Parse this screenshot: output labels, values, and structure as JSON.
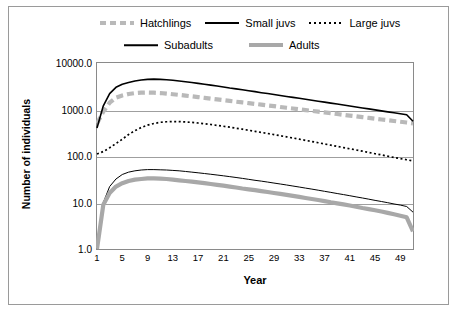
{
  "chart_data": {
    "type": "line",
    "title": "",
    "xlabel": "Year",
    "ylabel": "Number of individuals",
    "yscale": "log",
    "ylim": [
      1.0,
      10000.0
    ],
    "xlim": [
      1,
      51
    ],
    "grid": true,
    "legend_position": "top",
    "ytick_labels": [
      "10000.0",
      "1000.0",
      "100.0",
      "10.0",
      "1.0"
    ],
    "ytick_values": [
      10000,
      1000,
      100,
      10,
      1
    ],
    "xtick_labels": [
      "1",
      "5",
      "9",
      "13",
      "17",
      "21",
      "25",
      "29",
      "33",
      "37",
      "41",
      "45",
      "49"
    ],
    "xtick_values": [
      1,
      5,
      9,
      13,
      17,
      21,
      25,
      29,
      33,
      37,
      41,
      45,
      49
    ],
    "series": [
      {
        "name": "Hatchlings",
        "color": "#b9b9b9",
        "style": "dashed-thick",
        "x": [
          1,
          2,
          3,
          4,
          5,
          6,
          7,
          8,
          9,
          10,
          11,
          12,
          13,
          14,
          15,
          16,
          17,
          18,
          19,
          20,
          21,
          22,
          23,
          24,
          25,
          26,
          27,
          28,
          29,
          30,
          31,
          32,
          33,
          34,
          35,
          36,
          37,
          38,
          39,
          40,
          41,
          42,
          43,
          44,
          45,
          46,
          47,
          48,
          49,
          50,
          51
        ],
        "values": [
          500,
          900,
          1400,
          1800,
          2000,
          2150,
          2250,
          2300,
          2320,
          2300,
          2260,
          2200,
          2130,
          2060,
          1990,
          1920,
          1850,
          1780,
          1710,
          1650,
          1590,
          1530,
          1470,
          1420,
          1370,
          1320,
          1270,
          1220,
          1180,
          1130,
          1090,
          1050,
          1010,
          970,
          935,
          900,
          865,
          835,
          800,
          770,
          740,
          715,
          685,
          660,
          635,
          610,
          590,
          565,
          545,
          525,
          505
        ]
      },
      {
        "name": "Small juvs",
        "color": "#000000",
        "style": "solid-medium",
        "x": [
          1,
          2,
          3,
          4,
          5,
          6,
          7,
          8,
          9,
          10,
          11,
          12,
          13,
          14,
          15,
          16,
          17,
          18,
          19,
          20,
          21,
          22,
          23,
          24,
          25,
          26,
          27,
          28,
          29,
          30,
          31,
          32,
          33,
          34,
          35,
          36,
          37,
          38,
          39,
          40,
          41,
          42,
          43,
          44,
          45,
          46,
          47,
          48,
          49,
          50,
          51
        ],
        "values": [
          400,
          1200,
          2200,
          3000,
          3500,
          3800,
          4100,
          4300,
          4450,
          4500,
          4450,
          4350,
          4250,
          4100,
          3950,
          3800,
          3650,
          3500,
          3350,
          3200,
          3050,
          2900,
          2780,
          2650,
          2530,
          2420,
          2300,
          2200,
          2100,
          2000,
          1910,
          1820,
          1740,
          1660,
          1580,
          1510,
          1440,
          1370,
          1310,
          1250,
          1190,
          1130,
          1080,
          1030,
          980,
          935,
          890,
          850,
          810,
          770,
          560
        ]
      },
      {
        "name": "Large juvs",
        "color": "#000000",
        "style": "dotted-medium",
        "x": [
          1,
          2,
          3,
          4,
          5,
          6,
          7,
          8,
          9,
          10,
          11,
          12,
          13,
          14,
          15,
          16,
          17,
          18,
          19,
          20,
          21,
          22,
          23,
          24,
          25,
          26,
          27,
          28,
          29,
          30,
          31,
          32,
          33,
          34,
          35,
          36,
          37,
          38,
          39,
          40,
          41,
          42,
          43,
          44,
          45,
          46,
          47,
          48,
          49,
          50,
          51
        ],
        "values": [
          110,
          125,
          150,
          185,
          230,
          290,
          350,
          410,
          460,
          500,
          530,
          545,
          550,
          548,
          540,
          528,
          512,
          495,
          475,
          456,
          436,
          416,
          396,
          377,
          358,
          340,
          322,
          305,
          289,
          273,
          258,
          244,
          230,
          217,
          205,
          193,
          182,
          171,
          161,
          152,
          143,
          135,
          127,
          119,
          112,
          106,
          99,
          93,
          88,
          83,
          78
        ]
      },
      {
        "name": "Subadults",
        "color": "#000000",
        "style": "solid-thin",
        "x": [
          1,
          2,
          3,
          4,
          5,
          6,
          7,
          8,
          9,
          10,
          11,
          12,
          13,
          14,
          15,
          16,
          17,
          18,
          19,
          20,
          21,
          22,
          23,
          24,
          25,
          26,
          27,
          28,
          29,
          30,
          31,
          32,
          33,
          34,
          35,
          36,
          37,
          38,
          39,
          40,
          41,
          42,
          43,
          44,
          45,
          46,
          47,
          48,
          49,
          50,
          51
        ],
        "values": [
          1.0,
          10,
          22,
          32,
          40,
          45,
          48,
          50,
          51,
          51,
          50.5,
          50,
          49,
          48,
          46.5,
          45,
          43.5,
          42,
          40.5,
          39,
          37.5,
          36,
          34.5,
          33,
          31.5,
          30,
          28.8,
          27.5,
          26.2,
          25,
          23.8,
          22.6,
          21.5,
          20.4,
          19.4,
          18.4,
          17.4,
          16.5,
          15.6,
          14.8,
          14,
          13.2,
          12.5,
          11.8,
          11.1,
          10.5,
          9.9,
          9.3,
          8.8,
          8.2,
          6.2
        ]
      },
      {
        "name": "Adults",
        "color": "#a8a8a8",
        "style": "solid-thick",
        "x": [
          1,
          2,
          3,
          4,
          5,
          6,
          7,
          8,
          9,
          10,
          11,
          12,
          13,
          14,
          15,
          16,
          17,
          18,
          19,
          20,
          21,
          22,
          23,
          24,
          25,
          26,
          27,
          28,
          29,
          30,
          31,
          32,
          33,
          34,
          35,
          36,
          37,
          38,
          39,
          40,
          41,
          42,
          43,
          44,
          45,
          46,
          47,
          48,
          49,
          50,
          51
        ],
        "values": [
          1.0,
          9,
          16,
          22,
          26,
          29,
          31,
          32,
          33,
          33,
          32.5,
          32,
          31,
          30,
          29,
          28,
          27,
          26,
          25,
          24,
          23,
          22,
          21,
          20,
          19.2,
          18.4,
          17.6,
          16.8,
          16,
          15.3,
          14.6,
          13.9,
          13.2,
          12.5,
          11.9,
          11.3,
          10.7,
          10.1,
          9.6,
          9.1,
          8.6,
          8.1,
          7.6,
          7.2,
          6.8,
          6.4,
          6,
          5.6,
          5.2,
          4.8,
          2.4
        ]
      }
    ]
  },
  "legend": {
    "items": [
      {
        "label": "Hatchlings",
        "key": "hatchlings"
      },
      {
        "label": "Small juvs",
        "key": "smalljuvs"
      },
      {
        "label": "Large juvs",
        "key": "largejuvs"
      },
      {
        "label": "Subadults",
        "key": "subadults"
      },
      {
        "label": "Adults",
        "key": "adults"
      }
    ]
  },
  "axes": {
    "ylabel": "Number of individuals",
    "xlabel": "Year"
  }
}
